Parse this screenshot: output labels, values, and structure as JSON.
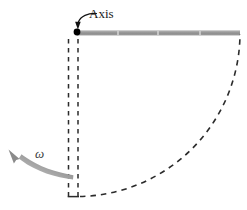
{
  "figure": {
    "background_color": "#ffffff",
    "width": 247,
    "height": 210,
    "labels": {
      "axis": "Axis",
      "omega": "ω"
    },
    "colors": {
      "rod": "#9a9a9a",
      "rod_highlight": "#bdbdbd",
      "pivot_dot": "#000000",
      "dashed_line": "#2b2b2b",
      "omega_arrow": "#8f8f8f",
      "label_text": "#1a1a1a",
      "omega_text": "#3d3d3d",
      "leader_line": "#111111"
    },
    "elements": [
      {
        "name": "pivot-dot",
        "type": "point",
        "x": 77,
        "y": 32,
        "radius": 3.4
      },
      {
        "name": "rod",
        "type": "horizontal-bar",
        "x1": 77,
        "x2": 240,
        "y": 33,
        "thickness": 5,
        "segment_marks": [
          118,
          158,
          200
        ]
      },
      {
        "name": "rod-vertical-dashed-outline",
        "type": "dashed-rectangle",
        "left_x": 68,
        "right_x": 78,
        "top_y": 38,
        "bottom_y": 197
      },
      {
        "name": "swing-arc",
        "type": "dashed-quarter-arc",
        "center_x": 78,
        "center_y": 33,
        "radius": 163,
        "start_angle_deg": 90,
        "end_angle_deg": 0
      },
      {
        "name": "axis-leader",
        "type": "curved-arrow",
        "from_x": 96,
        "from_y": 14,
        "to_x": 77,
        "to_y": 28
      },
      {
        "name": "omega-arrow",
        "type": "tapered-curved-arrow",
        "from_x": 72,
        "from_y": 178,
        "to_x": 10,
        "to_y": 152
      }
    ]
  }
}
